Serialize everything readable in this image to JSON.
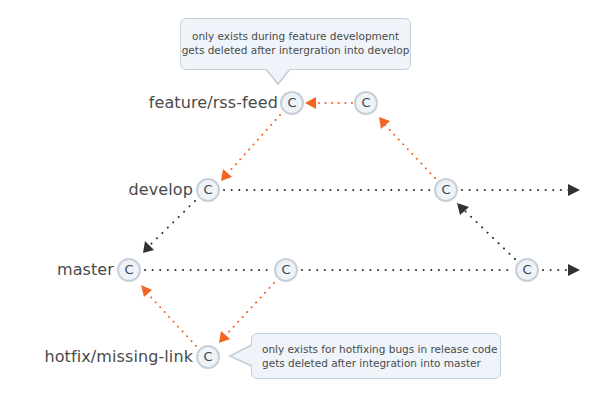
{
  "colors": {
    "merge_arrow": "#333333",
    "branch_arrow": "#f26522",
    "node_fill": "#eef3f8",
    "node_border": "#c7cfd8",
    "callout_fill": "#eef4f9",
    "callout_border": "#c7d0d8",
    "label_text": "#4a4a4a"
  },
  "branches": [
    {
      "name": "feature/rss-feed"
    },
    {
      "name": "develop"
    },
    {
      "name": "master"
    },
    {
      "name": "hotfix/missing-link"
    }
  ],
  "commit_label": "C",
  "commits": [
    {
      "id": "feature-1",
      "branch": "feature/rss-feed",
      "label": "C",
      "x": 292,
      "y": 103
    },
    {
      "id": "feature-2",
      "branch": "feature/rss-feed",
      "label": "C",
      "x": 366,
      "y": 103
    },
    {
      "id": "develop-1",
      "branch": "develop",
      "label": "C",
      "x": 208,
      "y": 190
    },
    {
      "id": "develop-2",
      "branch": "develop",
      "label": "C",
      "x": 446,
      "y": 190
    },
    {
      "id": "master-1",
      "branch": "master",
      "label": "C",
      "x": 129,
      "y": 270
    },
    {
      "id": "master-2",
      "branch": "master",
      "label": "C",
      "x": 286,
      "y": 270
    },
    {
      "id": "master-3",
      "branch": "master",
      "label": "C",
      "x": 527,
      "y": 270
    },
    {
      "id": "hotfix-1",
      "branch": "hotfix/missing-link",
      "label": "C",
      "x": 208,
      "y": 357
    }
  ],
  "edges": [
    {
      "from": "feature-2",
      "to": "feature-1",
      "style": "orange-dotted"
    },
    {
      "from": "feature-1",
      "to": "develop-1",
      "style": "orange-dotted"
    },
    {
      "from": "develop-2",
      "to": "feature-2",
      "style": "orange-dotted"
    },
    {
      "from": "develop-1",
      "to": "develop-2",
      "style": "dark-dotted"
    },
    {
      "from": "develop-2",
      "to": "continuation",
      "style": "dark-dotted"
    },
    {
      "from": "develop-1",
      "to": "master-1",
      "style": "dark-dotted"
    },
    {
      "from": "master-1",
      "to": "master-2",
      "style": "dark-dotted"
    },
    {
      "from": "master-2",
      "to": "master-3",
      "style": "dark-dotted"
    },
    {
      "from": "master-3",
      "to": "continuation",
      "style": "dark-dotted"
    },
    {
      "from": "master-3",
      "to": "develop-2",
      "style": "dark-dotted"
    },
    {
      "from": "master-2",
      "to": "hotfix-1",
      "style": "orange-dotted"
    },
    {
      "from": "hotfix-1",
      "to": "master-1",
      "style": "orange-dotted"
    }
  ],
  "callouts": {
    "feature": {
      "lines": [
        "only exists during feature development",
        "gets deleted after intergration into develop"
      ]
    },
    "hotfix": {
      "lines": [
        "only exists for hotfixing bugs in release code",
        "gets deleted after integration into master"
      ]
    }
  }
}
